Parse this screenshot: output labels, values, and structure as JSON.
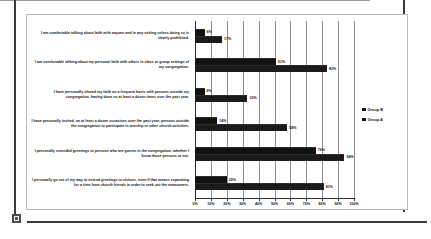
{
  "chart_data": {
    "type": "bar",
    "orientation": "horizontal",
    "title": "",
    "subtitle": "",
    "xlabel": "",
    "ylabel": "",
    "xlim": [
      0,
      100
    ],
    "grid": true,
    "legend_position": "right",
    "tick_labels": [
      "0%",
      "10%",
      "20%",
      "30%",
      "40%",
      "50%",
      "60%",
      "70%",
      "80%",
      "90%",
      "100%"
    ],
    "tick_values": [
      0,
      10,
      20,
      30,
      40,
      50,
      60,
      70,
      80,
      90,
      100
    ],
    "categories": [
      "I am comfortable talking about faith with anyone and in any setting unless doing so is clearly prohibited.",
      "I am comfortable talking about my personal faith with others in class or group settings of my congregation.",
      "I have personally shared my faith on a frequent basis with persons outside my congregation, having done so at least a dozen times over the past year.",
      "I have personally invited, on at least a dozen occasions over the past year, persons outside the congregation to participate in worship or other church activities.",
      "I personally extended greetings to persons who are guests in the congregation, whether I know those persons or not.",
      "I personally go out of my way to extend greetings to visitors, even if that means separating for a time from church friends in order to seek out the newcomers."
    ],
    "series": [
      {
        "name": "Group B",
        "color": "#121212",
        "values": [
          6,
          51,
          6,
          14,
          76,
          20
        ],
        "labels": [
          "6%",
          "51%",
          "6%",
          "14%",
          "76%",
          "20%"
        ]
      },
      {
        "name": "Group A",
        "color": "#1b1b1b",
        "values": [
          17,
          83,
          33,
          58,
          94,
          81
        ],
        "labels": [
          "17%",
          "83%",
          "33%",
          "58%",
          "94%",
          "81%"
        ]
      }
    ]
  },
  "legend": {
    "items": [
      {
        "label": "Group B"
      },
      {
        "label": "Group A"
      }
    ]
  }
}
